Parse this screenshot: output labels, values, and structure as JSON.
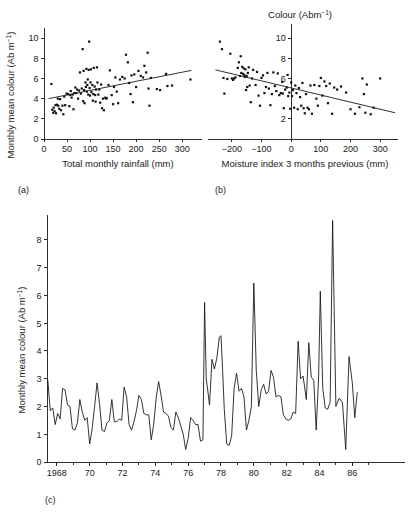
{
  "figure": {
    "background": "#ffffff",
    "ink": "#111111"
  },
  "panels": {
    "a": {
      "letter": "(a)",
      "xlabel": "Total monthly rainfall (mm)",
      "ylabel_main": "Monthly mean colour (Ab m",
      "ylabel_sup": "−1",
      "ylabel_tail": ")",
      "xticks": [
        "0",
        "50",
        "100",
        "150",
        "200",
        "250",
        "300"
      ],
      "yticks": [
        "2",
        "4",
        "6",
        "8",
        "10"
      ],
      "ytick_zero": "0"
    },
    "b": {
      "letter": "(b)",
      "title_main": "Colour (Abm",
      "title_sup": "−1",
      "title_tail": ")",
      "xlabel": "Moisture index 3 months previous (mm)",
      "xticks": [
        "−200",
        "−100",
        "0",
        "100",
        "200",
        "300"
      ],
      "yticks": [
        "2",
        "6",
        "8",
        "10"
      ]
    },
    "c": {
      "letter": "(c)",
      "ylabel_main": "Monthly mean colour (Ab m",
      "ylabel_sup": "−1",
      "ylabel_tail": ")",
      "xticks": [
        "1968",
        "70",
        "72",
        "74",
        "76",
        "78",
        "80",
        "82",
        "84",
        "86"
      ],
      "yticks": [
        "0",
        "1",
        "2",
        "3",
        "4",
        "5",
        "6",
        "7",
        "8"
      ]
    }
  },
  "chart_data": [
    {
      "id": "panel-a",
      "type": "scatter",
      "title": "",
      "xlabel": "Total monthly rainfall (mm)",
      "ylabel": "Monthly mean colour (Ab m−1)",
      "xlim": [
        0,
        330
      ],
      "ylim": [
        0,
        11
      ],
      "xticks": [
        0,
        50,
        100,
        150,
        200,
        250,
        300
      ],
      "yticks": [
        0,
        2,
        4,
        6,
        8,
        10
      ],
      "grid": false,
      "legend": "none",
      "trendline": {
        "x": [
          10,
          320
        ],
        "y": [
          4.0,
          6.8
        ]
      },
      "points": [
        [
          16,
          5.45
        ],
        [
          18,
          2.9
        ],
        [
          20,
          2.6
        ],
        [
          21,
          3.1
        ],
        [
          23,
          2.75
        ],
        [
          25,
          3.35
        ],
        [
          26,
          2.55
        ],
        [
          28,
          3.4
        ],
        [
          30,
          4.0
        ],
        [
          31,
          3.3
        ],
        [
          33,
          3.0
        ],
        [
          35,
          3.95
        ],
        [
          37,
          2.85
        ],
        [
          40,
          3.3
        ],
        [
          42,
          2.45
        ],
        [
          44,
          4.2
        ],
        [
          46,
          3.35
        ],
        [
          49,
          4.5
        ],
        [
          52,
          4.45
        ],
        [
          55,
          3.25
        ],
        [
          57,
          4.35
        ],
        [
          58,
          4.75
        ],
        [
          60,
          4.1
        ],
        [
          62,
          4.4
        ],
        [
          64,
          2.95
        ],
        [
          66,
          4.55
        ],
        [
          68,
          5.1
        ],
        [
          70,
          4.55
        ],
        [
          72,
          4.9
        ],
        [
          74,
          4.0
        ],
        [
          76,
          4.8
        ],
        [
          78,
          6.6
        ],
        [
          80,
          4.5
        ],
        [
          82,
          5.0
        ],
        [
          84,
          8.9
        ],
        [
          85,
          3.75
        ],
        [
          86,
          6.75
        ],
        [
          87,
          4.85
        ],
        [
          88,
          3.55
        ],
        [
          90,
          5.6
        ],
        [
          91,
          5.15
        ],
        [
          92,
          6.95
        ],
        [
          93,
          4.7
        ],
        [
          94,
          5.35
        ],
        [
          95,
          5.9
        ],
        [
          96,
          4.4
        ],
        [
          97,
          6.85
        ],
        [
          98,
          9.65
        ],
        [
          99,
          5.05
        ],
        [
          100,
          4.3
        ],
        [
          101,
          5.6
        ],
        [
          102,
          6.9
        ],
        [
          103,
          4.65
        ],
        [
          105,
          5.35
        ],
        [
          106,
          3.8
        ],
        [
          107,
          4.45
        ],
        [
          108,
          7.05
        ],
        [
          110,
          5.2
        ],
        [
          111,
          4.35
        ],
        [
          112,
          3.7
        ],
        [
          113,
          4.9
        ],
        [
          115,
          7.1
        ],
        [
          116,
          5.6
        ],
        [
          118,
          4.4
        ],
        [
          120,
          4.9
        ],
        [
          122,
          3.6
        ],
        [
          124,
          5.4
        ],
        [
          126,
          3.05
        ],
        [
          128,
          4.0
        ],
        [
          130,
          2.85
        ],
        [
          133,
          4.1
        ],
        [
          135,
          4.0
        ],
        [
          136,
          4.05
        ],
        [
          140,
          5.35
        ],
        [
          143,
          6.8
        ],
        [
          147,
          4.35
        ],
        [
          150,
          3.45
        ],
        [
          152,
          5.15
        ],
        [
          155,
          6.1
        ],
        [
          158,
          4.7
        ],
        [
          161,
          3.55
        ],
        [
          165,
          5.9
        ],
        [
          170,
          6.15
        ],
        [
          175,
          6.0
        ],
        [
          178,
          8.35
        ],
        [
          182,
          7.6
        ],
        [
          185,
          5.55
        ],
        [
          188,
          4.45
        ],
        [
          190,
          6.3
        ],
        [
          193,
          3.65
        ],
        [
          196,
          6.4
        ],
        [
          200,
          5.15
        ],
        [
          205,
          6.75
        ],
        [
          210,
          6.25
        ],
        [
          215,
          6.1
        ],
        [
          218,
          7.25
        ],
        [
          222,
          6.6
        ],
        [
          225,
          8.55
        ],
        [
          227,
          5.0
        ],
        [
          229,
          3.3
        ],
        [
          232,
          6.05
        ],
        [
          245,
          4.95
        ],
        [
          252,
          4.85
        ],
        [
          265,
          6.45
        ],
        [
          268,
          5.25
        ],
        [
          278,
          5.3
        ],
        [
          318,
          5.9
        ]
      ]
    },
    {
      "id": "panel-b",
      "type": "scatter",
      "title": "Colour (Abm−1)",
      "xlabel": "Moisture index 3 months previous (mm)",
      "ylabel": "",
      "xlim": [
        -260,
        360
      ],
      "ylim": [
        0,
        11
      ],
      "xticks": [
        -200,
        -100,
        0,
        100,
        200,
        300
      ],
      "yticks": [
        2,
        4,
        6,
        8,
        10
      ],
      "grid": false,
      "legend": "none",
      "trendline": {
        "x": [
          -255,
          350
        ],
        "y": [
          6.85,
          2.6
        ]
      },
      "points": [
        [
          -240,
          9.65
        ],
        [
          -233,
          8.9
        ],
        [
          -228,
          6.05
        ],
        [
          -225,
          4.5
        ],
        [
          -215,
          5.95
        ],
        [
          -205,
          8.45
        ],
        [
          -200,
          6.0
        ],
        [
          -196,
          5.85
        ],
        [
          -192,
          6.0
        ],
        [
          -188,
          6.1
        ],
        [
          -180,
          7.05
        ],
        [
          -176,
          7.6
        ],
        [
          -172,
          6.25
        ],
        [
          -170,
          8.2
        ],
        [
          -168,
          6.55
        ],
        [
          -165,
          7.15
        ],
        [
          -162,
          6.45
        ],
        [
          -160,
          7.0
        ],
        [
          -158,
          6.35
        ],
        [
          -156,
          6.15
        ],
        [
          -154,
          6.9
        ],
        [
          -152,
          4.85
        ],
        [
          -150,
          6.25
        ],
        [
          -148,
          5.15
        ],
        [
          -146,
          6.55
        ],
        [
          -143,
          7.1
        ],
        [
          -140,
          5.3
        ],
        [
          -136,
          3.65
        ],
        [
          -132,
          6.0
        ],
        [
          -128,
          6.85
        ],
        [
          -120,
          5.35
        ],
        [
          -115,
          6.65
        ],
        [
          -110,
          4.3
        ],
        [
          -105,
          3.3
        ],
        [
          -100,
          6.05
        ],
        [
          -95,
          6.3
        ],
        [
          -90,
          4.55
        ],
        [
          -85,
          5.15
        ],
        [
          -80,
          6.55
        ],
        [
          -75,
          5.0
        ],
        [
          -70,
          3.35
        ],
        [
          -65,
          4.45
        ],
        [
          -60,
          6.6
        ],
        [
          -55,
          5.25
        ],
        [
          -50,
          4.75
        ],
        [
          -45,
          6.5
        ],
        [
          -40,
          4.35
        ],
        [
          -35,
          4.55
        ],
        [
          -30,
          5.65
        ],
        [
          -28,
          4.5
        ],
        [
          -25,
          3.05
        ],
        [
          -20,
          4.9
        ],
        [
          -15,
          5.1
        ],
        [
          -12,
          6.35
        ],
        [
          -10,
          4.25
        ],
        [
          -6,
          4.6
        ],
        [
          -3,
          3.0
        ],
        [
          0,
          5.6
        ],
        [
          3,
          4.25
        ],
        [
          6,
          4.85
        ],
        [
          10,
          3.1
        ],
        [
          14,
          5.3
        ],
        [
          18,
          4.55
        ],
        [
          22,
          2.95
        ],
        [
          26,
          5.05
        ],
        [
          30,
          4.15
        ],
        [
          34,
          3.3
        ],
        [
          38,
          5.55
        ],
        [
          42,
          3.05
        ],
        [
          46,
          2.55
        ],
        [
          50,
          4.45
        ],
        [
          55,
          3.1
        ],
        [
          60,
          2.95
        ],
        [
          65,
          5.3
        ],
        [
          70,
          2.5
        ],
        [
          78,
          5.35
        ],
        [
          85,
          4.0
        ],
        [
          90,
          3.3
        ],
        [
          95,
          5.25
        ],
        [
          100,
          6.05
        ],
        [
          105,
          4.3
        ],
        [
          112,
          5.7
        ],
        [
          118,
          5.25
        ],
        [
          124,
          3.55
        ],
        [
          130,
          5.5
        ],
        [
          138,
          2.5
        ],
        [
          145,
          5.1
        ],
        [
          155,
          4.9
        ],
        [
          168,
          5.2
        ],
        [
          185,
          4.6
        ],
        [
          200,
          2.95
        ],
        [
          215,
          2.5
        ],
        [
          230,
          3.15
        ],
        [
          240,
          6.0
        ],
        [
          245,
          4.45
        ],
        [
          250,
          2.6
        ],
        [
          255,
          5.4
        ],
        [
          268,
          2.45
        ],
        [
          278,
          3.1
        ],
        [
          300,
          6.0
        ]
      ]
    },
    {
      "id": "panel-c",
      "type": "line",
      "title": "",
      "xlabel": "",
      "ylabel": "Monthly mean colour (Ab m−1)",
      "xlim": [
        1967.4,
        1987.2
      ],
      "ylim": [
        0,
        8.9
      ],
      "xticks": [
        1968,
        1970,
        1972,
        1974,
        1976,
        1978,
        1980,
        1982,
        1984,
        1986
      ],
      "xticklabels": [
        "1968",
        "70",
        "72",
        "74",
        "76",
        "78",
        "80",
        "82",
        "84",
        "86"
      ],
      "yticks": [
        0,
        1,
        2,
        3,
        4,
        5,
        6,
        7,
        8
      ],
      "grid": false,
      "legend": "none",
      "series": [
        {
          "name": "Monthly mean colour",
          "x": [
            1967.45,
            1967.6,
            1967.75,
            1967.9,
            1968.05,
            1968.2,
            1968.35,
            1968.5,
            1968.65,
            1968.8,
            1968.95,
            1969.1,
            1969.25,
            1969.4,
            1969.55,
            1969.7,
            1969.85,
            1970.0,
            1970.15,
            1970.3,
            1970.45,
            1970.6,
            1970.75,
            1970.9,
            1971.05,
            1971.2,
            1971.35,
            1971.5,
            1971.65,
            1971.8,
            1971.95,
            1972.1,
            1972.25,
            1972.4,
            1972.55,
            1972.7,
            1972.85,
            1973.0,
            1973.15,
            1973.3,
            1973.45,
            1973.6,
            1973.75,
            1973.9,
            1974.05,
            1974.2,
            1974.35,
            1974.5,
            1974.65,
            1974.8,
            1974.95,
            1975.1,
            1975.25,
            1975.4,
            1975.55,
            1975.7,
            1975.85,
            1976.0,
            1976.15,
            1976.3,
            1976.45,
            1976.6,
            1976.75,
            1976.9,
            1977.0,
            1977.1,
            1977.2,
            1977.3,
            1977.45,
            1977.6,
            1977.75,
            1977.9,
            1978.0,
            1978.1,
            1978.2,
            1978.35,
            1978.5,
            1978.65,
            1978.8,
            1978.95,
            1979.1,
            1979.25,
            1979.4,
            1979.55,
            1979.7,
            1979.85,
            1980.0,
            1980.15,
            1980.3,
            1980.45,
            1980.6,
            1980.75,
            1980.9,
            1981.05,
            1981.2,
            1981.35,
            1981.5,
            1981.65,
            1981.8,
            1981.95,
            1982.1,
            1982.25,
            1982.4,
            1982.55,
            1982.7,
            1982.85,
            1983.0,
            1983.2,
            1983.35,
            1983.5,
            1983.65,
            1983.8,
            1983.95,
            1984.05,
            1984.2,
            1984.35,
            1984.5,
            1984.65,
            1984.8,
            1985.0,
            1985.2,
            1985.4,
            1985.6,
            1985.8,
            1986.0,
            1986.15,
            1986.3,
            1986.45,
            1986.6,
            1986.75,
            1986.9
          ],
          "y": [
            2.95,
            1.85,
            1.95,
            1.35,
            1.75,
            1.55,
            2.65,
            2.6,
            2.05,
            2.0,
            1.2,
            1.15,
            1.4,
            2.25,
            1.8,
            1.5,
            1.6,
            0.65,
            1.2,
            2.0,
            2.85,
            2.1,
            1.15,
            1.1,
            1.4,
            1.5,
            2.25,
            1.45,
            1.45,
            1.55,
            1.5,
            2.7,
            2.35,
            1.35,
            1.15,
            1.45,
            1.85,
            2.4,
            2.25,
            1.75,
            1.7,
            1.7,
            0.8,
            1.35,
            2.3,
            2.9,
            2.4,
            1.8,
            1.75,
            1.65,
            1.25,
            1.15,
            1.8,
            1.6,
            1.3,
            1.0,
            0.45,
            0.85,
            1.6,
            1.5,
            1.35,
            1.35,
            0.75,
            0.8,
            5.75,
            3.0,
            2.55,
            2.05,
            3.7,
            3.35,
            3.75,
            4.5,
            4.55,
            3.3,
            1.9,
            0.65,
            0.6,
            0.95,
            2.65,
            3.2,
            2.55,
            2.65,
            2.35,
            1.15,
            1.5,
            2.0,
            6.45,
            3.3,
            2.0,
            2.6,
            2.8,
            2.45,
            2.55,
            3.3,
            3.05,
            2.35,
            2.4,
            2.35,
            1.7,
            1.55,
            1.5,
            1.55,
            1.8,
            1.75,
            4.35,
            3.0,
            3.1,
            2.25,
            4.3,
            3.05,
            2.95,
            1.15,
            3.1,
            6.15,
            2.65,
            1.95,
            1.9,
            2.15,
            8.7,
            2.0,
            2.3,
            2.15,
            0.45,
            3.8,
            2.85,
            1.6,
            2.5
          ]
        }
      ]
    }
  ]
}
